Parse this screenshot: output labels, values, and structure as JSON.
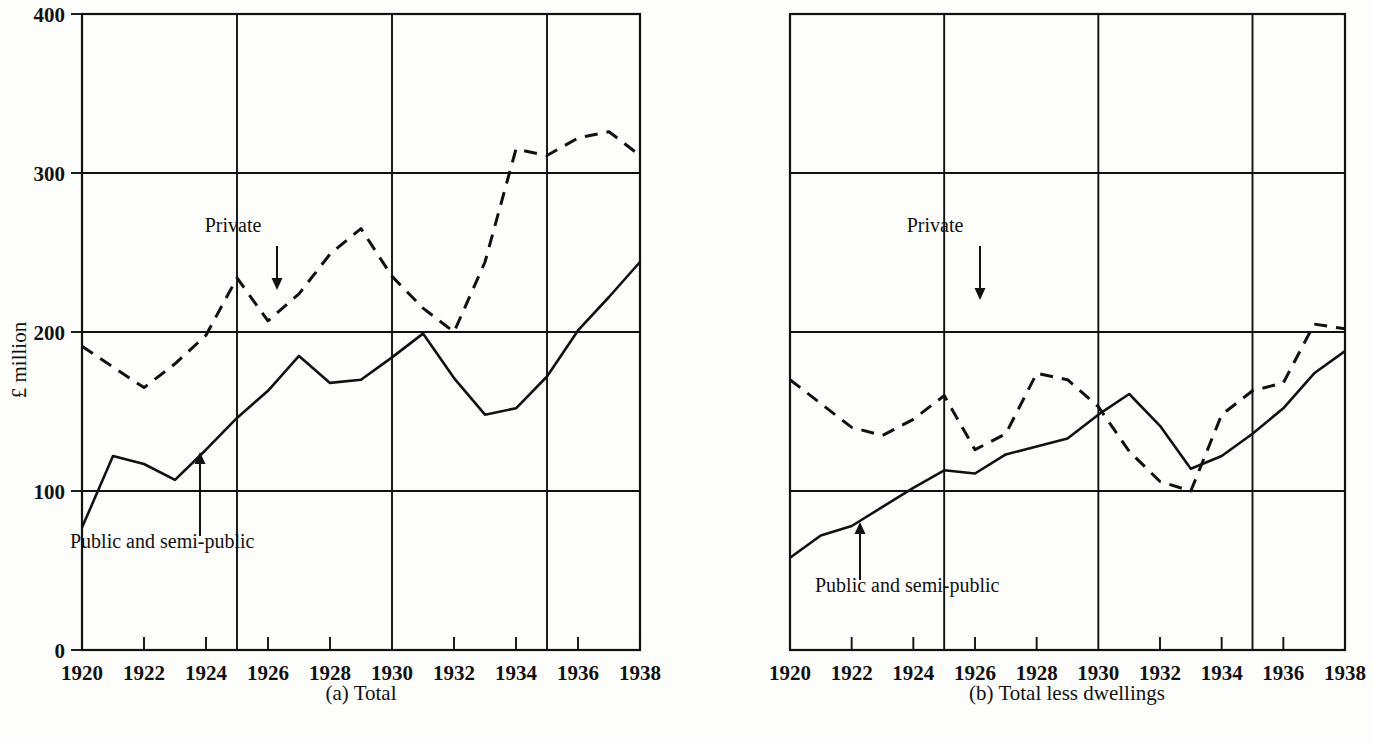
{
  "figure": {
    "ylabel": "£ million",
    "panels": [
      {
        "id": "panel-a",
        "caption": "(a) Total",
        "private_label": "Private",
        "public_label": "Public and semi-public"
      },
      {
        "id": "panel-b",
        "caption": "(b) Total less dwellings",
        "private_label": "Private",
        "public_label": "Public and semi-public"
      }
    ]
  },
  "chart_data": [
    {
      "type": "line",
      "title": "(a) Total",
      "xlabel": "",
      "ylabel": "£ million",
      "xlim": [
        1920,
        1938
      ],
      "ylim": [
        0,
        400
      ],
      "yticks": [
        0,
        100,
        200,
        300,
        400
      ],
      "ytick_labels": [
        "0",
        "100",
        "200",
        "300",
        "400"
      ],
      "xticks": [
        1920,
        1922,
        1924,
        1926,
        1928,
        1930,
        1932,
        1934,
        1936,
        1938
      ],
      "xtick_labels": [
        "1920",
        "1922",
        "1924",
        "1926",
        "1928",
        "1930",
        "1932",
        "1934",
        "1936",
        "1938"
      ],
      "x_gridlines": [
        1925,
        1930,
        1935
      ],
      "y_gridlines": [
        100,
        200,
        300
      ],
      "grid": true,
      "legend": "annotated-arrows",
      "x": [
        1920,
        1921,
        1922,
        1923,
        1924,
        1925,
        1926,
        1927,
        1928,
        1929,
        1930,
        1931,
        1932,
        1933,
        1934,
        1935,
        1936,
        1937,
        1938
      ],
      "series": [
        {
          "name": "Public and semi-public",
          "style": "solid",
          "values": [
            77,
            122,
            117,
            107,
            126,
            146,
            163,
            185,
            168,
            170,
            184,
            199,
            171,
            148,
            152,
            172,
            201,
            222,
            244
          ]
        },
        {
          "name": "Private",
          "style": "dashed",
          "values": [
            191,
            178,
            165,
            180,
            198,
            234,
            207,
            224,
            249,
            265,
            235,
            215,
            200,
            244,
            315,
            311,
            322,
            326,
            311
          ]
        }
      ],
      "annotations": [
        {
          "text": "Private",
          "at_year": 1925,
          "arrow": "down"
        },
        {
          "text": "Public and semi-public",
          "at_year": 1923.7,
          "arrow": "up"
        }
      ]
    },
    {
      "type": "line",
      "title": "(b) Total less dwellings",
      "xlabel": "",
      "ylabel": "£ million",
      "xlim": [
        1920,
        1938
      ],
      "ylim": [
        0,
        400
      ],
      "yticks": [
        0,
        100,
        200,
        300,
        400
      ],
      "ytick_labels": [
        "",
        "",
        "",
        "",
        ""
      ],
      "xticks": [
        1920,
        1922,
        1924,
        1926,
        1928,
        1930,
        1932,
        1934,
        1936,
        1938
      ],
      "xtick_labels": [
        "1920",
        "1922",
        "1924",
        "1926",
        "1928",
        "1930",
        "1932",
        "1934",
        "1936",
        "1938"
      ],
      "x_gridlines": [
        1925,
        1930,
        1935
      ],
      "y_gridlines": [
        100,
        200,
        300
      ],
      "grid": true,
      "legend": "annotated-arrows",
      "x": [
        1920,
        1921,
        1922,
        1923,
        1924,
        1925,
        1926,
        1927,
        1928,
        1929,
        1930,
        1931,
        1932,
        1933,
        1934,
        1935,
        1936,
        1937,
        1938
      ],
      "series": [
        {
          "name": "Public and semi-public",
          "style": "solid",
          "values": [
            58,
            72,
            78,
            90,
            102,
            113,
            111,
            123,
            128,
            133,
            148,
            161,
            141,
            114,
            122,
            136,
            152,
            174,
            188
          ]
        },
        {
          "name": "Private",
          "style": "dashed",
          "values": [
            170,
            155,
            140,
            135,
            145,
            160,
            126,
            136,
            174,
            170,
            153,
            125,
            106,
            100,
            148,
            163,
            168,
            205,
            202
          ]
        }
      ],
      "annotations": [
        {
          "text": "Private",
          "at_year": 1925,
          "arrow": "down"
        },
        {
          "text": "Public and semi-public",
          "at_year": 1921.6,
          "arrow": "up"
        }
      ]
    }
  ],
  "colors": {
    "ink": "#111111",
    "paper": "#fdfdfb"
  }
}
